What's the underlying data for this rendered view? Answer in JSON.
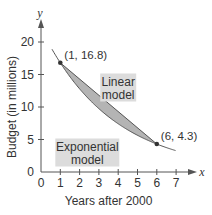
{
  "chart_data": {
    "type": "line",
    "title": "",
    "xlabel": "Years after 2000",
    "ylabel": "Budget (in millions)",
    "x_axis_var": "x",
    "y_axis_var": "y",
    "xlim": [
      0,
      7
    ],
    "ylim": [
      0,
      20
    ],
    "x_ticks": [
      0,
      1,
      2,
      3,
      4,
      5,
      6,
      7
    ],
    "y_ticks": [
      0,
      5,
      10,
      15,
      20
    ],
    "grid": false,
    "points": [
      {
        "x": 1,
        "y": 16.8,
        "label": "(1, 16.8)"
      },
      {
        "x": 6,
        "y": 4.3,
        "label": "(6, 4.3)"
      }
    ],
    "series": [
      {
        "name": "Linear model",
        "kind": "linear",
        "x": [
          1,
          6
        ],
        "y": [
          16.8,
          4.3
        ]
      },
      {
        "name": "Exponential model",
        "kind": "exponential",
        "x": [
          0.57,
          1,
          2,
          3,
          4,
          5,
          6,
          7
        ],
        "y": [
          19.2,
          16.8,
          12.79,
          9.74,
          7.42,
          5.65,
          4.3,
          3.27
        ]
      }
    ],
    "shaded_region": "between linear and exponential models from x=1 to x=6",
    "annotations": [
      {
        "text": [
          "Linear",
          "model"
        ],
        "x": 4.0,
        "y": 13.0
      },
      {
        "text": [
          "Exponential",
          "model"
        ],
        "x": 2.4,
        "y": 3.0
      }
    ],
    "colors": {
      "axis": "#555555",
      "curve": "#555555",
      "fill": "#b4b4b4",
      "label_box": "#dcdcdc",
      "point": "#333333"
    }
  }
}
